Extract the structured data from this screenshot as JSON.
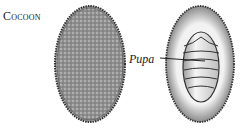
{
  "labels": {
    "cocoon": "Cocoon",
    "pupa": "Pupa"
  },
  "figure": {
    "left_object": "closed-cocoon",
    "right_object": "cocoon-cross-section-with-pupa",
    "pupa_segments": 5
  },
  "colors": {
    "ink": "#222222",
    "cocoon_fill": "#9a9a9a",
    "cocoon_inner": "#e4e4e4",
    "background": "#ffffff"
  }
}
